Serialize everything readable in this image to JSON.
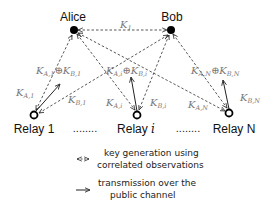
{
  "nodes": {
    "alice": {
      "label": "Alice"
    },
    "bob": {
      "label": "Bob"
    },
    "relay1": {
      "label": "Relay 1"
    },
    "relayi": {
      "label": "Relay ",
      "index": "i"
    },
    "relayN": {
      "label": "Relay N"
    }
  },
  "ellipsis": "........",
  "keys": {
    "k1": {
      "base": "K",
      "sub": "1"
    },
    "ka1": {
      "base": "K",
      "sub": "A,1"
    },
    "kb1": {
      "base": "K",
      "sub": "B,1"
    },
    "kai": {
      "base": "K",
      "sub": "A,i"
    },
    "kbi": {
      "base": "K",
      "sub": "B,i"
    },
    "kaN": {
      "base": "K",
      "sub": "A,N"
    },
    "kbN": {
      "base": "K",
      "sub": "B,N"
    },
    "xor": "⊕"
  },
  "legend": {
    "dashed": {
      "line1": "key generation using",
      "line2": "correlated observations"
    },
    "solid": {
      "line1": "transmission over the",
      "line2": "public channel"
    }
  },
  "colors": {
    "line": "#333333",
    "label": "#777777",
    "node": "#000000"
  }
}
